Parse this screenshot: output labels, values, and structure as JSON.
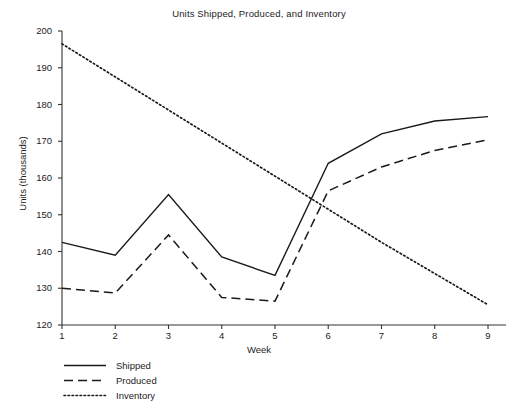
{
  "chart_data": {
    "type": "line",
    "title": "Units Shipped, Produced, and Inventory",
    "xlabel": "Week",
    "ylabel": "Units (thousands)",
    "x": [
      1,
      2,
      3,
      4,
      5,
      6,
      7,
      8,
      9
    ],
    "xtick_labels": [
      "1",
      "2",
      "3",
      "4",
      "5",
      "6",
      "7",
      "8",
      "9"
    ],
    "ytick_labels": [
      "120",
      "130",
      "140",
      "150",
      "160",
      "170",
      "180",
      "190",
      "200"
    ],
    "ytick_values": [
      120,
      130,
      140,
      150,
      160,
      170,
      180,
      190,
      200
    ],
    "xlim": [
      1,
      9
    ],
    "ylim": [
      120,
      200
    ],
    "grid": false,
    "legend_position": "below-left",
    "series": [
      {
        "name": "Shipped",
        "style": "solid",
        "color": "#1a1a1a",
        "values": [
          142.5,
          139.0,
          155.5,
          138.5,
          133.5,
          164.0,
          172.0,
          175.5,
          176.7
        ]
      },
      {
        "name": "Produced",
        "style": "dashed",
        "color": "#1a1a1a",
        "values": [
          130.0,
          128.7,
          144.5,
          127.5,
          126.5,
          156.5,
          163.0,
          167.5,
          170.4
        ]
      },
      {
        "name": "Inventory",
        "style": "dotted",
        "color": "#1a1a1a",
        "values": [
          196.5,
          187.5,
          178.5,
          169.5,
          160.5,
          151.5,
          142.5,
          134.0,
          125.5
        ]
      }
    ]
  },
  "legend": {
    "items": [
      {
        "label": "Shipped"
      },
      {
        "label": "Produced"
      },
      {
        "label": "Inventory"
      }
    ]
  }
}
